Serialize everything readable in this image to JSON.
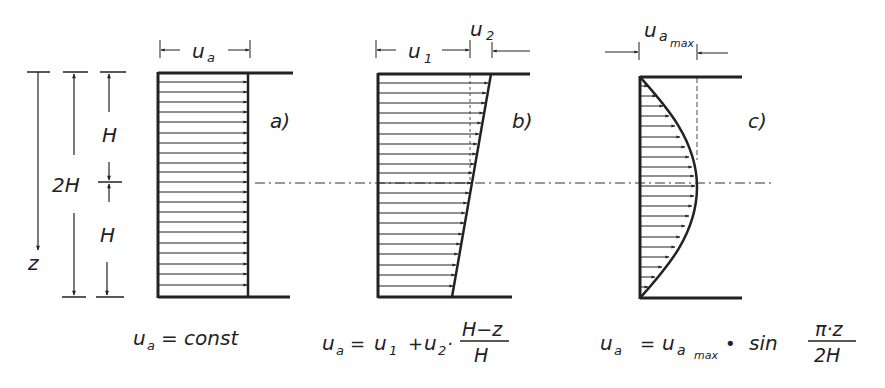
{
  "figure": {
    "ink_color": "#222222",
    "background": "#ffffff",
    "dimensions": {
      "total_height_label": "2H",
      "upper_half_label": "H",
      "lower_half_label": "H",
      "depth_axis_label": "z"
    },
    "panels": [
      {
        "id": "a",
        "tag": "a)",
        "width_label": "u",
        "width_label_sub": "a",
        "profile": "constant",
        "formula": {
          "lhs": "u",
          "lhs_sub": "a",
          "rhs": "= const"
        }
      },
      {
        "id": "b",
        "tag": "b)",
        "width_label_1": "u",
        "width_label_1_sub": "1",
        "width_label_2": "u",
        "width_label_2_sub": "2",
        "profile": "linear",
        "formula": {
          "lhs": "u",
          "lhs_sub": "a",
          "eq": "=",
          "t1": "u",
          "t1_sub": "1",
          "plus": "+",
          "t2": "u",
          "t2_sub": "2",
          "dot": "·",
          "num": "H−z",
          "den": "H"
        }
      },
      {
        "id": "c",
        "tag": "c)",
        "width_label": "u",
        "width_label_sub": "a",
        "width_label_subsub": "max",
        "profile": "sinusoidal",
        "formula": {
          "lhs": "u",
          "lhs_sub": "a",
          "eq": "=",
          "t1": "u",
          "t1_sub": "a",
          "t1_subsub": "max",
          "dot": "•",
          "fn": "sin",
          "num": "π·z",
          "den": "2H"
        }
      }
    ]
  }
}
